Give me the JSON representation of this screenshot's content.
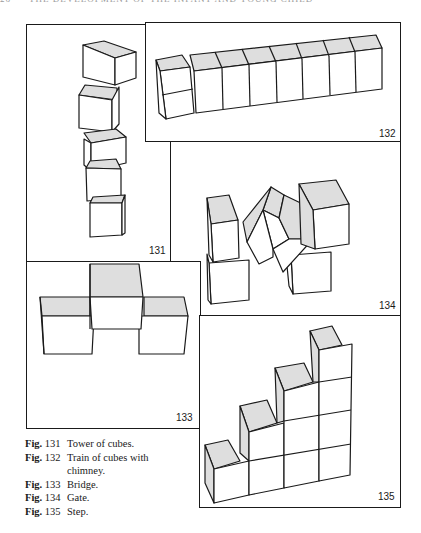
{
  "page": {
    "running_head": {
      "page_number": "26",
      "title": "THE DEVELOPMENT OF THE INFANT AND YOUNG CHILD"
    },
    "colors": {
      "ink": "#1a1a1a",
      "shade": "#dedede",
      "paper": "#ffffff"
    }
  },
  "figures": [
    {
      "number": "131",
      "title": "Tower of cubes.",
      "cube_count": 5
    },
    {
      "number": "132",
      "title": "Train of cubes with chimney.",
      "cube_count": 10
    },
    {
      "number": "133",
      "title": "Bridge.",
      "cube_count": 3
    },
    {
      "number": "134",
      "title": "Gate.",
      "cube_count": 5
    },
    {
      "number": "135",
      "title": "Step.",
      "cube_count": 10
    }
  ],
  "captions": [
    {
      "label": "Fig.",
      "number": "131",
      "text": "Tower of cubes."
    },
    {
      "label": "Fig.",
      "number": "132",
      "text": "Train of cubes with chimney."
    },
    {
      "label": "Fig.",
      "number": "133",
      "text": "Bridge."
    },
    {
      "label": "Fig.",
      "number": "134",
      "text": "Gate."
    },
    {
      "label": "Fig.",
      "number": "135",
      "text": "Step."
    }
  ]
}
